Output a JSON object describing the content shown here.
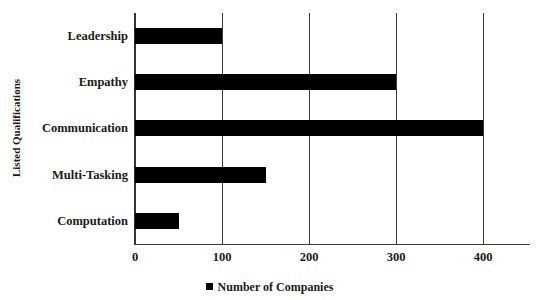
{
  "chart_data": {
    "type": "bar",
    "orientation": "horizontal",
    "title": "",
    "xlabel": "",
    "ylabel": "Listed Qualifications",
    "categories": [
      "Leadership",
      "Empathy",
      "Communication",
      "Multi-Tasking",
      "Computation"
    ],
    "values": [
      100,
      300,
      400,
      150,
      50
    ],
    "series": [
      {
        "name": "Number of Companies",
        "values": [
          100,
          300,
          400,
          150,
          50
        ],
        "color": "#000000"
      }
    ],
    "xlim": [
      0,
      400
    ],
    "xticks": [
      0,
      100,
      200,
      300,
      400
    ],
    "xtick_labels": [
      "0",
      "100",
      "200",
      "300",
      "400"
    ],
    "grid": "vertical",
    "legend": {
      "position": "bottom",
      "entries": [
        {
          "label": "Number of Companies",
          "marker": "square",
          "color": "#000000"
        }
      ]
    },
    "colors": {
      "bar": "#000000",
      "axis": "#3b3b3b",
      "gridline": "#3a3a3a",
      "background": "#ffffff",
      "text": "#1a1a1a"
    }
  }
}
